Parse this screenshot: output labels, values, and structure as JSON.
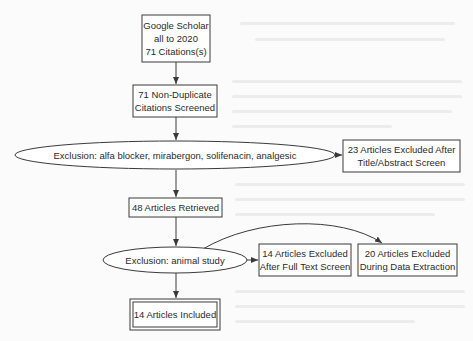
{
  "diagram": {
    "type": "flowchart",
    "title": "",
    "colors": {
      "stroke": "#3a3a3a",
      "text": "#2a2a2a",
      "background": "#fbfbfb",
      "box_fill": "#ffffff"
    },
    "nodes": {
      "source": {
        "lines": [
          "Google Scholar",
          "all to 2020",
          "71 Citations(s)"
        ],
        "shape": "box"
      },
      "screened": {
        "lines": [
          "71 Non-Duplicate",
          "Citations Screened"
        ],
        "shape": "box"
      },
      "exclusion1": {
        "lines": [
          "Exclusion: alfa blocker, mirabergon, solifenacin, analgesic"
        ],
        "shape": "ellipse"
      },
      "excluded_title": {
        "lines": [
          "23 Articles Excluded After",
          "Title/Abstract Screen"
        ],
        "shape": "box"
      },
      "retrieved": {
        "lines": [
          "48 Articles Retrieved"
        ],
        "shape": "box"
      },
      "exclusion2": {
        "lines": [
          "Exclusion: animal study"
        ],
        "shape": "ellipse"
      },
      "excluded_fulltext": {
        "lines": [
          "14 Articles Excluded",
          "After Full Text Screen"
        ],
        "shape": "box"
      },
      "excluded_extraction": {
        "lines": [
          "20 Articles Excluded",
          "During Data Extraction"
        ],
        "shape": "box"
      },
      "included": {
        "lines": [
          "14 Articles Included"
        ],
        "shape": "double-box"
      }
    },
    "edges": [
      {
        "from": "source",
        "to": "screened"
      },
      {
        "from": "screened",
        "to": "exclusion1"
      },
      {
        "from": "exclusion1",
        "to": "excluded_title"
      },
      {
        "from": "exclusion1",
        "to": "retrieved"
      },
      {
        "from": "retrieved",
        "to": "exclusion2"
      },
      {
        "from": "exclusion2",
        "to": "excluded_fulltext"
      },
      {
        "from": "exclusion2",
        "to": "excluded_extraction",
        "style": "curved"
      },
      {
        "from": "exclusion2",
        "to": "included"
      }
    ]
  }
}
